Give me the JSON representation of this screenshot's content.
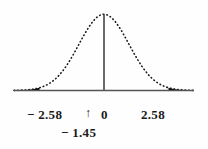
{
  "figure": {
    "background_color": "#fefefe",
    "ink_color": "#1a1a1a",
    "axis_color": "#555555"
  },
  "axis_labels": {
    "left_critical": "− 2.58",
    "arrow_marker": "↑",
    "center": "0",
    "right_critical": "2.58",
    "test_statistic": "− 1.45"
  },
  "chart_data": {
    "type": "area",
    "title": "",
    "xlabel": "",
    "ylabel": "",
    "distribution": "standard-normal",
    "curve_style": "dotted",
    "mean": 0,
    "sd": 1,
    "xlim": [
      -3.6,
      3.6
    ],
    "ylim": [
      0,
      0.4
    ],
    "grid": false,
    "legend": null,
    "tick_values": [
      -2.58,
      0,
      2.58
    ],
    "tick_labels": [
      "− 2.58",
      "0",
      "2.58"
    ],
    "center_line": {
      "x": 0,
      "label": "0",
      "style": "solid"
    },
    "shaded_regions": [
      {
        "name": "left-rejection-region",
        "from": -3.6,
        "to": -2.58,
        "fill": "#000000"
      },
      {
        "name": "right-rejection-region",
        "from": 2.58,
        "to": 3.6,
        "fill": "#000000"
      }
    ],
    "markers": [
      {
        "name": "test-statistic",
        "x": -1.45,
        "label": "− 1.45",
        "glyph": "↑"
      }
    ],
    "x": [
      -3.6,
      -3.45,
      -3.3,
      -3.15,
      -3.0,
      -2.85,
      -2.7,
      -2.58,
      -2.4,
      -2.25,
      -2.1,
      -1.95,
      -1.8,
      -1.65,
      -1.5,
      -1.35,
      -1.2,
      -1.05,
      -0.9,
      -0.75,
      -0.6,
      -0.45,
      -0.3,
      -0.15,
      0.0,
      0.15,
      0.3,
      0.45,
      0.6,
      0.75,
      0.9,
      1.05,
      1.2,
      1.35,
      1.5,
      1.65,
      1.8,
      1.95,
      2.1,
      2.25,
      2.4,
      2.58,
      2.7,
      2.85,
      3.0,
      3.15,
      3.3,
      3.45,
      3.6
    ],
    "y": [
      0.0006,
      0.001,
      0.0017,
      0.0028,
      0.0044,
      0.0069,
      0.0104,
      0.0143,
      0.0224,
      0.0317,
      0.044,
      0.0596,
      0.079,
      0.1023,
      0.1295,
      0.1604,
      0.1942,
      0.2299,
      0.2661,
      0.3011,
      0.3332,
      0.3605,
      0.3814,
      0.3945,
      0.3989,
      0.3945,
      0.3814,
      0.3605,
      0.3332,
      0.3011,
      0.2661,
      0.2299,
      0.1942,
      0.1604,
      0.1295,
      0.1023,
      0.079,
      0.0596,
      0.044,
      0.0317,
      0.0224,
      0.0143,
      0.0104,
      0.0069,
      0.0044,
      0.0028,
      0.0017,
      0.001,
      0.0006
    ]
  }
}
